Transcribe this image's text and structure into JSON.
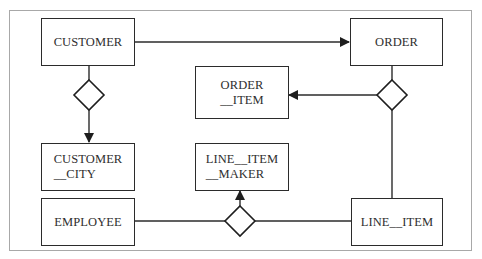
{
  "diagram": {
    "type": "entity-relationship",
    "entities": [
      {
        "id": "customer",
        "lines": [
          "CUSTOMER"
        ]
      },
      {
        "id": "order",
        "lines": [
          "ORDER"
        ]
      },
      {
        "id": "order_item",
        "lines": [
          "ORDER",
          "__ITEM"
        ]
      },
      {
        "id": "customer_city",
        "lines": [
          "CUSTOMER",
          "__CITY"
        ]
      },
      {
        "id": "line_item_maker",
        "lines": [
          "LINE__ITEM",
          "__MAKER"
        ]
      },
      {
        "id": "employee",
        "lines": [
          "EMPLOYEE"
        ]
      },
      {
        "id": "line_item",
        "lines": [
          "LINE__ITEM"
        ]
      }
    ],
    "relationships": [
      {
        "id": "rel-customer-city",
        "shape": "diamond",
        "connects": [
          "CUSTOMER",
          "CUSTOMER__CITY"
        ],
        "arrow_to": "CUSTOMER__CITY"
      },
      {
        "id": "rel-order-orderitem-lineitem",
        "shape": "diamond",
        "connects": [
          "ORDER",
          "ORDER__ITEM",
          "LINE__ITEM"
        ],
        "arrow_to": "ORDER__ITEM"
      },
      {
        "id": "rel-employee-maker-lineitem",
        "shape": "diamond",
        "connects": [
          "EMPLOYEE",
          "LINE__ITEM__MAKER",
          "LINE__ITEM"
        ],
        "arrow_to": "LINE__ITEM__MAKER"
      }
    ],
    "direct_links": [
      {
        "from": "CUSTOMER",
        "to": "ORDER",
        "arrow_to": "ORDER"
      }
    ],
    "colors": {
      "stroke": "#2b2b2b",
      "text": "#2e2e2e",
      "frame": "#a8a8a8",
      "background": "#ffffff"
    }
  }
}
